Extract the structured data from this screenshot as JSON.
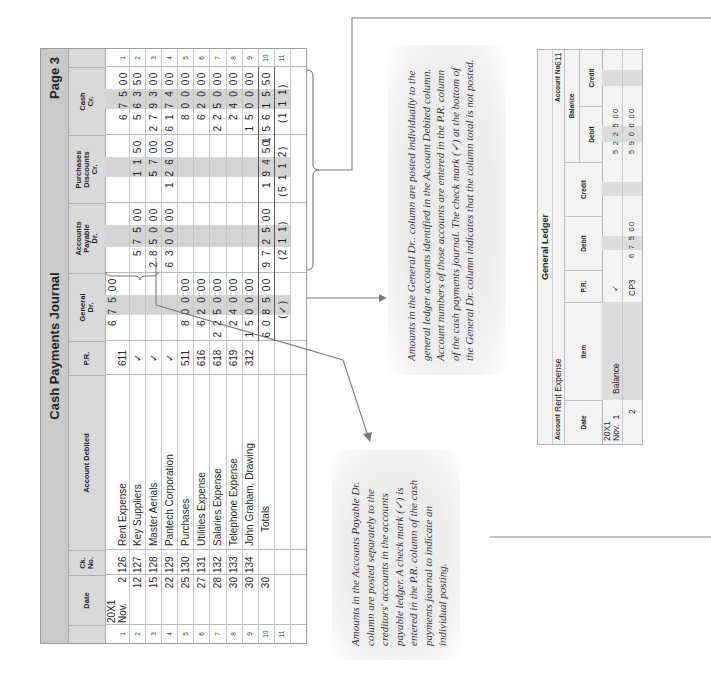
{
  "journal": {
    "title": "Cash Payments Journal",
    "page": "Page 3",
    "columns": {
      "date": "Date",
      "ck_no": "Ck.\nNo.",
      "account_debited": "Account Debited",
      "pr": "P.R.",
      "general_dr": "General\nDr.",
      "ap_dr": "Accounts\nPayable\nDr.",
      "purch_disc_cr": "Purchases\nDiscounts\nCr.",
      "cash_cr": "Cash\nCr."
    },
    "year_label": "20X1",
    "month_label": "Nov.",
    "rows": [
      {
        "n": "1",
        "day": "2",
        "ck": "126",
        "account": "Rent Expense",
        "pr": "611",
        "general": "6 7 5 00",
        "ap": "",
        "disc": "",
        "cash": "6 7 5 00"
      },
      {
        "n": "2",
        "day": "12",
        "ck": "127",
        "account": "Key Suppliers",
        "pr": "✓",
        "general": "",
        "ap": "5 7 5 00",
        "disc": "1 1 50",
        "cash": "5 6 3 50"
      },
      {
        "n": "3",
        "day": "15",
        "ck": "128",
        "account": "Master Aerials",
        "pr": "✓",
        "general": "",
        "ap": "2 8 5 0 00",
        "disc": "5 7 00",
        "cash": "2 7 9 3 00"
      },
      {
        "n": "4",
        "day": "22",
        "ck": "129",
        "account": "Pantech Corporation",
        "pr": "✓",
        "general": "",
        "ap": "6 3 0 0 00",
        "disc": "1 2 6 00",
        "cash": "6 1 7 4 00"
      },
      {
        "n": "5",
        "day": "25",
        "ck": "130",
        "account": "Purchases",
        "pr": "511",
        "general": "8 0 0 00",
        "ap": "",
        "disc": "",
        "cash": "8 0 0 00"
      },
      {
        "n": "6",
        "day": "27",
        "ck": "131",
        "account": "Utilities Expense",
        "pr": "616",
        "general": "6 2 0 00",
        "ap": "",
        "disc": "",
        "cash": "6 2 0 00"
      },
      {
        "n": "7",
        "day": "28",
        "ck": "132",
        "account": "Salaries Expense",
        "pr": "618",
        "general": "2 2 5 0 00",
        "ap": "",
        "disc": "",
        "cash": "2 2 5 0 00"
      },
      {
        "n": "8",
        "day": "30",
        "ck": "133",
        "account": "Telephone Expense",
        "pr": "619",
        "general": "2 4 0 00",
        "ap": "",
        "disc": "",
        "cash": "2 4 0 00"
      },
      {
        "n": "9",
        "day": "30",
        "ck": "134",
        "account": "John Graham, Drawing",
        "pr": "312",
        "general": "1 5 0 0 00",
        "ap": "",
        "disc": "",
        "cash": "1 5 0 0 00"
      },
      {
        "n": "10",
        "day": "30",
        "ck": "",
        "account": "Totals",
        "pr": "",
        "general": "6 0 8 5 00",
        "ap": "9 7 2 5 00",
        "disc": "1 9 4 50",
        "cash": "1 5 6 1 5 50"
      },
      {
        "n": "11",
        "day": "",
        "ck": "",
        "account": "",
        "pr": "",
        "general": "(✓)",
        "ap": "(2 1 1)",
        "disc": "(5 1 1 2)",
        "cash": "(1 1 1)"
      }
    ]
  },
  "notes": {
    "general": "Amounts in the General Dr.. column are posted individually to the general ledger accounts identified in the Account Debited column. Account numbers of those accounts are entered in the P.R. column of the cash payments journal. The check mark (✓) at the bottom of the General Dr. column indicates that the column total is not posted.",
    "ap": "Amounts in the Accounts Payable Dr. column are posted separately to the creditors' accounts in the accounts payable ledger. A check mark (✓) is entered in the P.R. column of the cash payments journal to indicate an individual posting."
  },
  "ledger": {
    "title": "General Ledger",
    "account_label": "Account",
    "account_name": "Rent Expense",
    "account_no_label": "Account No.",
    "account_no": "611",
    "columns": {
      "date": "Date",
      "item": "Item",
      "pr": "P.R.",
      "debit": "Debit",
      "credit": "Credit",
      "balance": "Balance",
      "bal_debit": "Debit",
      "bal_credit": "Credit"
    },
    "year_label": "20X1",
    "month_label": "Nov.",
    "rows": [
      {
        "day": "1",
        "item": "Balance",
        "pr": "✓",
        "debit": "",
        "credit": "",
        "bal_debit": "5 2 2 5 00",
        "bal_credit": ""
      },
      {
        "day": "2",
        "item": "",
        "pr": "CP3",
        "debit": "6 7 5 00",
        "credit": "",
        "bal_debit": "5 9 0 0 00",
        "bal_credit": ""
      }
    ]
  },
  "colors": {
    "title_band": "#c9c9c9",
    "header_band": "#d9d9d9",
    "shaded_cell": "#d4d4d4",
    "line": "#7a7a7a"
  }
}
